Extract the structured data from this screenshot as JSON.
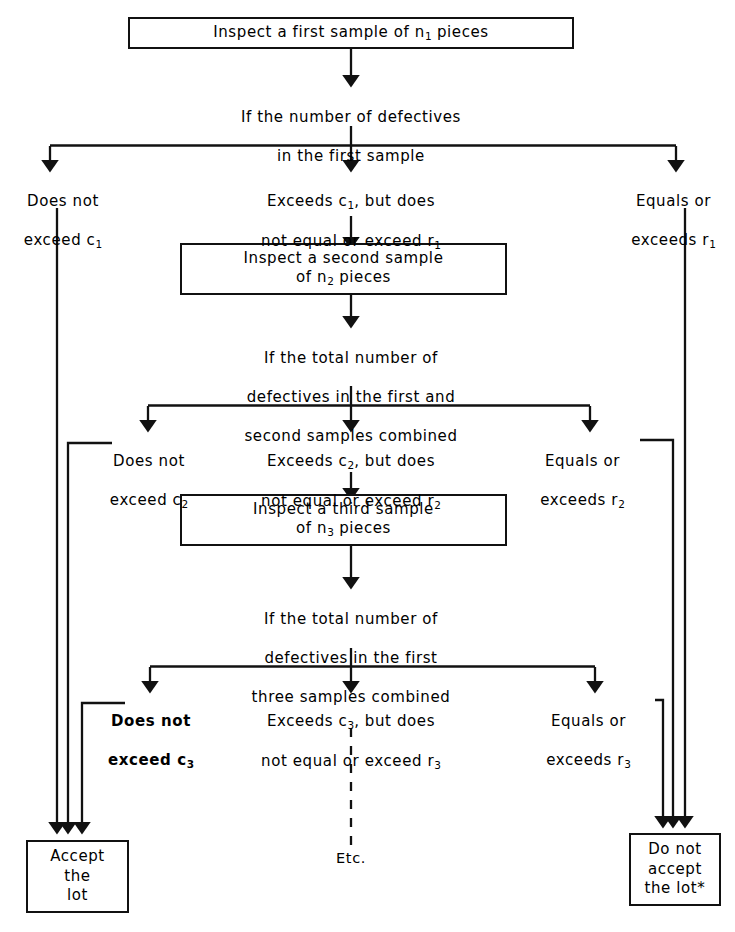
{
  "diagram": {
    "stroke_color": "#111111",
    "background": "#ffffff"
  },
  "boxes": {
    "first_sample": {
      "line1": "Inspect a first sample of n",
      "sub1": "1",
      "line1b": " pieces"
    },
    "second_sample": {
      "line1": "Inspect a second sample",
      "line2_pre": "of n",
      "sub": "2",
      "line2_post": " pieces"
    },
    "third_sample": {
      "line1": "Inspect a third sample",
      "line2_pre": "of n",
      "sub": "3",
      "line2_post": " pieces"
    },
    "accept": {
      "line1": "Accept",
      "line2": "the",
      "line3": "lot"
    },
    "reject": {
      "line1": "Do not",
      "line2": "accept",
      "line3": "the lot*"
    }
  },
  "questions": {
    "q1": {
      "line1": "If the number of defectives",
      "line2": "in the first sample"
    },
    "q2": {
      "line1": "If the total number of",
      "line2": "defectives in the first and",
      "line3": "second samples combined"
    },
    "q3": {
      "line1": "If the total number of",
      "line2": "defectives in the first",
      "line3": "three samples combined"
    }
  },
  "branches": {
    "stage1": {
      "left": {
        "line1": "Does not",
        "line2_pre": "exceed c",
        "sub": "1"
      },
      "middle": {
        "line1_pre": "Exceeds c",
        "sub": "1",
        "line1_post": ", but does",
        "line2_pre": "not equal or exceed r",
        "sub2": "1"
      },
      "right": {
        "line1": "Equals or",
        "line2_pre": "exceeds r",
        "sub": "1"
      }
    },
    "stage2": {
      "left": {
        "line1": "Does not",
        "line2_pre": "exceed c",
        "sub": "2"
      },
      "middle": {
        "line1_pre": "Exceeds c",
        "sub": "2",
        "line1_post": ", but does",
        "line2_pre": "not equal or exceed r",
        "sub2": "2"
      },
      "right": {
        "line1": "Equals or",
        "line2_pre": "exceeds r",
        "sub": "2"
      }
    },
    "stage3": {
      "left": {
        "line1": "Does not",
        "line2_pre": "exceed c",
        "sub": "3"
      },
      "middle": {
        "line1_pre": "Exceeds c",
        "sub": "3",
        "line1_post": ", but does",
        "line2_pre": "not equal or exceed r",
        "sub2": "3"
      },
      "right": {
        "line1": "Equals or",
        "line2_pre": "exceeds r",
        "sub": "3"
      }
    }
  },
  "continuation": {
    "label": "Etc."
  }
}
